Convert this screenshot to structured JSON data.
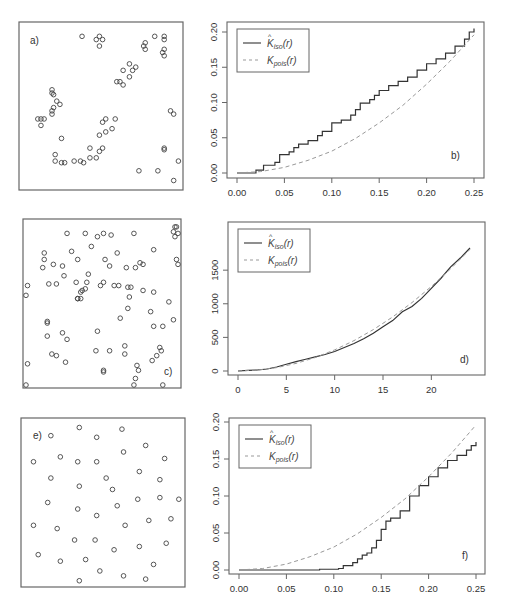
{
  "figure": {
    "panels": [
      {
        "id": "a",
        "label": "a)",
        "type": "point-pattern",
        "description": "clustered pattern"
      },
      {
        "id": "b",
        "label": "b)",
        "type": "line"
      },
      {
        "id": "c",
        "label": "c)",
        "type": "point-pattern",
        "description": "random (Poisson) pattern"
      },
      {
        "id": "d",
        "label": "d)",
        "type": "line"
      },
      {
        "id": "e",
        "label": "e)",
        "type": "point-pattern",
        "description": "regular pattern"
      },
      {
        "id": "f",
        "label": "f)",
        "type": "line"
      }
    ],
    "legend": {
      "entries": [
        {
          "label_main": "K",
          "label_hat": "^",
          "label_sub": "iso",
          "label_arg": "(r)",
          "style": "solid",
          "color": "#333333"
        },
        {
          "label_main": "K",
          "label_hat": "",
          "label_sub": "pois",
          "label_arg": "(r)",
          "style": "dashed",
          "color": "#999999"
        }
      ]
    },
    "colors": {
      "solid": "#333333",
      "dashed": "#999999",
      "axis": "#555555",
      "point": "#444444"
    }
  },
  "point_patterns": {
    "a": [
      [
        0.38,
        0.07
      ],
      [
        0.47,
        0.09
      ],
      [
        0.49,
        0.07
      ],
      [
        0.51,
        0.09
      ],
      [
        0.49,
        0.13
      ],
      [
        0.84,
        0.07
      ],
      [
        0.9,
        0.07
      ],
      [
        0.9,
        0.09
      ],
      [
        0.77,
        0.13
      ],
      [
        0.78,
        0.11
      ],
      [
        0.78,
        0.15
      ],
      [
        0.89,
        0.17
      ],
      [
        0.9,
        0.15
      ],
      [
        0.9,
        0.19
      ],
      [
        0.68,
        0.24
      ],
      [
        0.7,
        0.28
      ],
      [
        0.72,
        0.26
      ],
      [
        0.64,
        0.28
      ],
      [
        0.68,
        0.32
      ],
      [
        0.6,
        0.35
      ],
      [
        0.62,
        0.35
      ],
      [
        0.64,
        0.37
      ],
      [
        0.19,
        0.4
      ],
      [
        0.19,
        0.42
      ],
      [
        0.2,
        0.43
      ],
      [
        0.22,
        0.47
      ],
      [
        0.24,
        0.49
      ],
      [
        0.2,
        0.51
      ],
      [
        0.19,
        0.53
      ],
      [
        0.19,
        0.55
      ],
      [
        0.1,
        0.58
      ],
      [
        0.12,
        0.58
      ],
      [
        0.14,
        0.58
      ],
      [
        0.12,
        0.62
      ],
      [
        0.94,
        0.53
      ],
      [
        0.96,
        0.55
      ],
      [
        0.51,
        0.6
      ],
      [
        0.53,
        0.58
      ],
      [
        0.59,
        0.58
      ],
      [
        0.49,
        0.68
      ],
      [
        0.53,
        0.66
      ],
      [
        0.57,
        0.64
      ],
      [
        0.25,
        0.7
      ],
      [
        0.43,
        0.76
      ],
      [
        0.49,
        0.78
      ],
      [
        0.51,
        0.76
      ],
      [
        0.9,
        0.76
      ],
      [
        0.9,
        0.77
      ],
      [
        0.21,
        0.8
      ],
      [
        0.21,
        0.84
      ],
      [
        0.25,
        0.85
      ],
      [
        0.27,
        0.85
      ],
      [
        0.33,
        0.84
      ],
      [
        0.37,
        0.84
      ],
      [
        0.39,
        0.85
      ],
      [
        0.43,
        0.82
      ],
      [
        0.47,
        0.82
      ],
      [
        0.74,
        0.9
      ],
      [
        0.86,
        0.9
      ],
      [
        0.96,
        0.96
      ],
      [
        0.99,
        0.84
      ]
    ],
    "c": [
      [
        0.56,
        0.08
      ],
      [
        0.98,
        0.03
      ],
      [
        0.99,
        0.03
      ],
      [
        0.97,
        0.06
      ],
      [
        1.0,
        0.07
      ],
      [
        0.98,
        0.09
      ],
      [
        0.27,
        0.07
      ],
      [
        0.39,
        0.07
      ],
      [
        0.47,
        0.09
      ],
      [
        0.51,
        0.07
      ],
      [
        0.71,
        0.07
      ],
      [
        0.12,
        0.19
      ],
      [
        0.3,
        0.18
      ],
      [
        0.43,
        0.15
      ],
      [
        0.6,
        0.19
      ],
      [
        0.84,
        0.17
      ],
      [
        0.12,
        0.23
      ],
      [
        0.18,
        0.26
      ],
      [
        0.24,
        0.27
      ],
      [
        0.34,
        0.23
      ],
      [
        0.11,
        0.28
      ],
      [
        0.52,
        0.23
      ],
      [
        0.55,
        0.27
      ],
      [
        0.66,
        0.28
      ],
      [
        0.72,
        0.28
      ],
      [
        0.75,
        0.25
      ],
      [
        0.77,
        0.26
      ],
      [
        0.99,
        0.23
      ],
      [
        1.0,
        0.26
      ],
      [
        0.25,
        0.33
      ],
      [
        0.41,
        0.32
      ],
      [
        0.51,
        0.37
      ],
      [
        0.01,
        0.39
      ],
      [
        0.0,
        0.45
      ],
      [
        0.15,
        0.38
      ],
      [
        0.2,
        0.38
      ],
      [
        0.33,
        0.37
      ],
      [
        0.36,
        0.43
      ],
      [
        0.37,
        0.42
      ],
      [
        0.39,
        0.41
      ],
      [
        0.4,
        0.37
      ],
      [
        0.49,
        0.39
      ],
      [
        0.58,
        0.39
      ],
      [
        0.61,
        0.39
      ],
      [
        0.67,
        0.4
      ],
      [
        0.69,
        0.4
      ],
      [
        0.77,
        0.42
      ],
      [
        0.84,
        0.43
      ],
      [
        0.36,
        0.47
      ],
      [
        0.34,
        0.47
      ],
      [
        0.34,
        0.47
      ],
      [
        0.68,
        0.46
      ],
      [
        0.67,
        0.53
      ],
      [
        0.82,
        0.55
      ],
      [
        0.94,
        0.49
      ],
      [
        0.62,
        0.59
      ],
      [
        0.14,
        0.61
      ],
      [
        0.14,
        0.62
      ],
      [
        0.84,
        0.64
      ],
      [
        0.9,
        0.64
      ],
      [
        0.97,
        0.6
      ],
      [
        0.47,
        0.67
      ],
      [
        0.14,
        0.7
      ],
      [
        0.24,
        0.68
      ],
      [
        0.27,
        0.72
      ],
      [
        0.65,
        0.76
      ],
      [
        0.65,
        0.81
      ],
      [
        0.46,
        0.79
      ],
      [
        0.55,
        0.79
      ],
      [
        0.17,
        0.81
      ],
      [
        0.2,
        0.82
      ],
      [
        0.26,
        0.86
      ],
      [
        0.88,
        0.77
      ],
      [
        0.89,
        0.79
      ],
      [
        0.86,
        0.82
      ],
      [
        0.83,
        0.85
      ],
      [
        0.73,
        0.88
      ],
      [
        0.74,
        0.91
      ],
      [
        0.51,
        0.92
      ],
      [
        0.51,
        0.91
      ],
      [
        0.72,
        0.96
      ],
      [
        0.01,
        0.87
      ],
      [
        0.0,
        1.0
      ],
      [
        0.71,
        1.0
      ],
      [
        0.9,
        1.0
      ]
    ],
    "e": [
      [
        0.35,
        0.04
      ],
      [
        0.62,
        0.05
      ],
      [
        0.17,
        0.09
      ],
      [
        0.46,
        0.1
      ],
      [
        0.77,
        0.15
      ],
      [
        0.23,
        0.22
      ],
      [
        0.34,
        0.25
      ],
      [
        0.46,
        0.25
      ],
      [
        0.63,
        0.19
      ],
      [
        0.89,
        0.23
      ],
      [
        0.06,
        0.25
      ],
      [
        0.73,
        0.31
      ],
      [
        0.17,
        0.35
      ],
      [
        0.52,
        0.35
      ],
      [
        0.86,
        0.36
      ],
      [
        0.35,
        0.4
      ],
      [
        0.56,
        0.42
      ],
      [
        0.15,
        0.5
      ],
      [
        0.34,
        0.54
      ],
      [
        0.59,
        0.52
      ],
      [
        0.72,
        0.48
      ],
      [
        0.86,
        0.47
      ],
      [
        0.98,
        0.48
      ],
      [
        0.46,
        0.58
      ],
      [
        0.06,
        0.64
      ],
      [
        0.21,
        0.66
      ],
      [
        0.64,
        0.64
      ],
      [
        0.79,
        0.61
      ],
      [
        0.93,
        0.6
      ],
      [
        0.32,
        0.73
      ],
      [
        0.45,
        0.73
      ],
      [
        0.57,
        0.79
      ],
      [
        0.73,
        0.77
      ],
      [
        0.9,
        0.75
      ],
      [
        0.09,
        0.82
      ],
      [
        0.23,
        0.86
      ],
      [
        0.39,
        0.85
      ],
      [
        0.48,
        0.92
      ],
      [
        0.63,
        0.95
      ],
      [
        0.77,
        0.97
      ],
      [
        0.35,
        0.98
      ],
      [
        0.82,
        0.88
      ]
    ]
  },
  "chart_data": [
    {
      "panel": "b",
      "type": "line",
      "title": "",
      "xlabel": "",
      "ylabel": "",
      "xlim": [
        0,
        0.25
      ],
      "ylim": [
        0,
        0.2
      ],
      "xticks": [
        "0.00",
        "0.05",
        "0.10",
        "0.15",
        "0.20",
        "0.25"
      ],
      "yticks": [
        "0.00",
        "0.05",
        "0.10",
        "0.15",
        "0.20"
      ],
      "legend": [
        "K̂iso(r)",
        "Kpois(r)"
      ],
      "legend_position": "top-left",
      "annotation": "b)",
      "series": [
        {
          "name": "K_iso(r)",
          "style": "step-solid",
          "x": [
            0,
            0.017,
            0.02,
            0.028,
            0.04,
            0.045,
            0.055,
            0.06,
            0.065,
            0.075,
            0.085,
            0.09,
            0.1,
            0.11,
            0.12,
            0.125,
            0.13,
            0.14,
            0.145,
            0.15,
            0.16,
            0.17,
            0.18,
            0.19,
            0.2,
            0.21,
            0.22,
            0.23,
            0.24,
            0.245,
            0.25
          ],
          "y": [
            0,
            0,
            0.004,
            0.011,
            0.015,
            0.026,
            0.03,
            0.036,
            0.041,
            0.046,
            0.053,
            0.059,
            0.071,
            0.075,
            0.082,
            0.09,
            0.099,
            0.104,
            0.11,
            0.117,
            0.124,
            0.13,
            0.136,
            0.146,
            0.155,
            0.162,
            0.17,
            0.18,
            0.19,
            0.2,
            0.205
          ]
        },
        {
          "name": "K_pois(r)",
          "style": "dashed",
          "x": [
            0,
            0.025,
            0.05,
            0.075,
            0.1,
            0.125,
            0.15,
            0.175,
            0.2,
            0.225,
            0.25
          ],
          "y": [
            0,
            0.002,
            0.008,
            0.018,
            0.031,
            0.049,
            0.071,
            0.096,
            0.126,
            0.159,
            0.196
          ]
        }
      ]
    },
    {
      "panel": "d",
      "type": "line",
      "title": "",
      "xlabel": "",
      "ylabel": "",
      "xlim": [
        0,
        24
      ],
      "ylim": [
        0,
        1800
      ],
      "xticks": [
        "0",
        "5",
        "10",
        "15",
        "20"
      ],
      "yticks": [
        "0",
        "500",
        "1000",
        "1500"
      ],
      "legend": [
        "K̂iso(r)",
        "Kpois(r)"
      ],
      "legend_position": "top-left",
      "annotation": "d)",
      "series": [
        {
          "name": "K_iso(r)",
          "style": "solid",
          "x": [
            0,
            1,
            2,
            3,
            4,
            5,
            6,
            7,
            8,
            9,
            10,
            11,
            12,
            13,
            14,
            15,
            16,
            17,
            18,
            19,
            20,
            21,
            22,
            23,
            24
          ],
          "y": [
            0,
            8,
            15,
            30,
            60,
            100,
            140,
            175,
            210,
            245,
            290,
            350,
            410,
            480,
            560,
            660,
            750,
            880,
            960,
            1080,
            1230,
            1380,
            1550,
            1680,
            1830
          ]
        },
        {
          "name": "K_pois(r)",
          "style": "dashed",
          "x": [
            0,
            2,
            4,
            6,
            8,
            10,
            12,
            14,
            16,
            18,
            20,
            22,
            24
          ],
          "y": [
            0,
            13,
            50,
            113,
            201,
            314,
            452,
            616,
            804,
            1018,
            1257,
            1521,
            1810
          ]
        }
      ]
    },
    {
      "panel": "f",
      "type": "line",
      "title": "",
      "xlabel": "",
      "ylabel": "",
      "xlim": [
        0,
        0.25
      ],
      "ylim": [
        0,
        0.2
      ],
      "xticks": [
        "0.00",
        "0.05",
        "0.10",
        "0.15",
        "0.20",
        "0.25"
      ],
      "yticks": [
        "0.00",
        "0.05",
        "0.10",
        "0.15",
        "0.20"
      ],
      "legend": [
        "K̂iso(r)",
        "Kpois(r)"
      ],
      "legend_position": "top-left",
      "annotation": "f)",
      "series": [
        {
          "name": "K_iso(r)",
          "style": "step-solid",
          "x": [
            0,
            0.085,
            0.105,
            0.11,
            0.12,
            0.125,
            0.13,
            0.135,
            0.14,
            0.145,
            0.15,
            0.155,
            0.16,
            0.17,
            0.18,
            0.19,
            0.2,
            0.21,
            0.22,
            0.23,
            0.24,
            0.245,
            0.25
          ],
          "y": [
            0,
            0.001,
            0.002,
            0.006,
            0.01,
            0.015,
            0.02,
            0.023,
            0.03,
            0.04,
            0.055,
            0.066,
            0.07,
            0.08,
            0.1,
            0.114,
            0.126,
            0.138,
            0.148,
            0.155,
            0.162,
            0.168,
            0.173
          ]
        },
        {
          "name": "K_pois(r)",
          "style": "dashed",
          "x": [
            0,
            0.025,
            0.05,
            0.075,
            0.1,
            0.125,
            0.15,
            0.175,
            0.2,
            0.225,
            0.25
          ],
          "y": [
            0,
            0.002,
            0.008,
            0.018,
            0.031,
            0.049,
            0.071,
            0.096,
            0.126,
            0.159,
            0.196
          ]
        }
      ]
    }
  ],
  "layout": {
    "boxes": {
      "a": {
        "x": 19,
        "y": 22,
        "w": 164,
        "h": 168
      },
      "c": {
        "x": 23,
        "y": 219,
        "w": 158,
        "h": 169
      },
      "e": {
        "x": 21,
        "y": 418,
        "w": 164,
        "h": 169
      }
    },
    "plots": {
      "b": {
        "x": 227,
        "y": 22,
        "w": 257,
        "h": 156,
        "x0": 237,
        "x1": 474,
        "y0": 173,
        "y1": 32
      },
      "d": {
        "x": 228,
        "y": 222,
        "w": 257,
        "h": 153,
        "x0": 238,
        "x1": 470,
        "y0": 371,
        "y1": 250
      },
      "f": {
        "x": 229,
        "y": 418,
        "w": 256,
        "h": 156,
        "x0": 239,
        "x1": 476,
        "y0": 570,
        "y1": 422
      }
    }
  }
}
